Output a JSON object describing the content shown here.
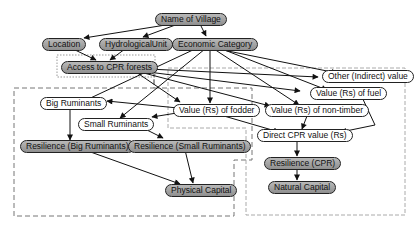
{
  "diagram": {
    "type": "causal-graph",
    "colors": {
      "filled_node": "#a3a3a3",
      "plain_node": "#ffffff",
      "edge": "#222222",
      "group_border": "#888888"
    },
    "nodes": {
      "name_of_village": {
        "label": "Name of Village",
        "style": "filled"
      },
      "location": {
        "label": "Location",
        "style": "filled"
      },
      "hydrological_unit": {
        "label": "HydrologicalUnit",
        "style": "filled"
      },
      "economic_category": {
        "label": "Economic Category",
        "style": "filled"
      },
      "access_cpr": {
        "label": "Access to CPR forests",
        "style": "filled"
      },
      "other_indirect": {
        "label": "Other (Indirect) value",
        "style": "plain"
      },
      "value_fuel": {
        "label": "Value (Rs) of fuel",
        "style": "plain"
      },
      "big_ruminants": {
        "label": "Big Ruminants",
        "style": "plain"
      },
      "value_fodder": {
        "label": "Value (Rs) of fodder",
        "style": "plain"
      },
      "small_ruminants": {
        "label": "Small Ruminants",
        "style": "plain"
      },
      "value_nontimber": {
        "label": "Value (Rs) of non-timber",
        "style": "plain"
      },
      "direct_cpr": {
        "label": "Direct CPR value (Rs)",
        "style": "plain"
      },
      "res_big": {
        "label": "Resilience  (Big Ruminants)",
        "style": "filled"
      },
      "res_small": {
        "label": "Resilience  (Small Ruminants)",
        "style": "filled"
      },
      "res_cpr": {
        "label": "Resilience (CPR)",
        "style": "filled"
      },
      "physical_capital": {
        "label": "Physical Capital",
        "style": "filled"
      },
      "natural_capital": {
        "label": "Natural Capital",
        "style": "filled"
      }
    },
    "edges": [
      [
        "name_of_village",
        "location"
      ],
      [
        "name_of_village",
        "hydrological_unit"
      ],
      [
        "name_of_village",
        "economic_category"
      ],
      [
        "location",
        "access_cpr"
      ],
      [
        "hydrological_unit",
        "access_cpr"
      ],
      [
        "economic_category",
        "big_ruminants"
      ],
      [
        "economic_category",
        "small_ruminants"
      ],
      [
        "economic_category",
        "value_fodder"
      ],
      [
        "economic_category",
        "other_indirect"
      ],
      [
        "economic_category",
        "value_fuel"
      ],
      [
        "economic_category",
        "value_nontimber"
      ],
      [
        "access_cpr",
        "value_fodder"
      ],
      [
        "access_cpr",
        "other_indirect"
      ],
      [
        "access_cpr",
        "value_fuel"
      ],
      [
        "access_cpr",
        "value_nontimber"
      ],
      [
        "value_fodder",
        "big_ruminants"
      ],
      [
        "value_fodder",
        "small_ruminants"
      ],
      [
        "value_fodder",
        "direct_cpr"
      ],
      [
        "value_fuel",
        "direct_cpr"
      ],
      [
        "value_nontimber",
        "direct_cpr"
      ],
      [
        "big_ruminants",
        "res_big"
      ],
      [
        "small_ruminants",
        "res_small"
      ],
      [
        "res_big",
        "physical_capital"
      ],
      [
        "res_small",
        "physical_capital"
      ],
      [
        "direct_cpr",
        "res_cpr"
      ],
      [
        "res_cpr",
        "natural_capital"
      ]
    ],
    "groups": [
      {
        "name": "access-group",
        "style": "dotted"
      },
      {
        "name": "livestock-physical-group",
        "style": "dashed"
      },
      {
        "name": "cpr-natural-group",
        "style": "dashed"
      }
    ]
  }
}
